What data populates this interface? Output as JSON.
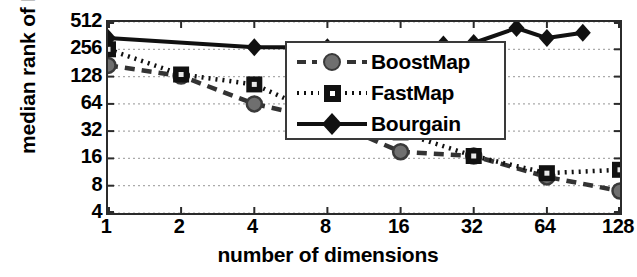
{
  "chart_data": {
    "type": "line",
    "title": "",
    "xlabel": "number of dimensions",
    "ylabel": "median rank of ENN",
    "xscale": "log2",
    "yscale": "log2",
    "xlim": [
      1,
      128
    ],
    "ylim": [
      4,
      512
    ],
    "xticks": [
      1,
      2,
      4,
      8,
      16,
      32,
      64,
      128
    ],
    "xtick_labels": [
      "1",
      "2",
      "4",
      "8",
      "16",
      "32",
      "64",
      "128"
    ],
    "yticks": [
      4,
      8,
      16,
      32,
      64,
      128,
      256,
      512
    ],
    "ytick_labels": [
      "4",
      "8",
      "16",
      "32",
      "64",
      "128",
      "256",
      "512"
    ],
    "grid": "horizontal-dotted",
    "legend_position": "upper-right-inside",
    "series": [
      {
        "name": "BoostMap",
        "marker": "circle",
        "linestyle": "dashed",
        "color": "#333333",
        "x": [
          1,
          2,
          4,
          8,
          16,
          32,
          64,
          128
        ],
        "y": [
          170,
          130,
          64,
          42,
          19,
          17,
          10,
          7
        ]
      },
      {
        "name": "FastMap",
        "marker": "square",
        "linestyle": "dotted",
        "color": "#111111",
        "x": [
          1,
          2,
          4,
          8,
          16,
          32,
          64,
          128
        ],
        "y": [
          256,
          135,
          105,
          45,
          31,
          17,
          11,
          12
        ]
      },
      {
        "name": "Bourgain",
        "marker": "diamond",
        "linestyle": "solid",
        "color": "#111111",
        "x": [
          1,
          4,
          8,
          16,
          24,
          32,
          48,
          64,
          90
        ],
        "y": [
          340,
          270,
          270,
          200,
          290,
          300,
          440,
          340,
          390
        ]
      }
    ]
  },
  "legend": {
    "items": [
      {
        "label": "BoostMap",
        "marker": "circle",
        "linestyle": "dashed"
      },
      {
        "label": "FastMap",
        "marker": "square",
        "linestyle": "dotted"
      },
      {
        "label": "Bourgain",
        "marker": "diamond",
        "linestyle": "solid"
      }
    ]
  }
}
